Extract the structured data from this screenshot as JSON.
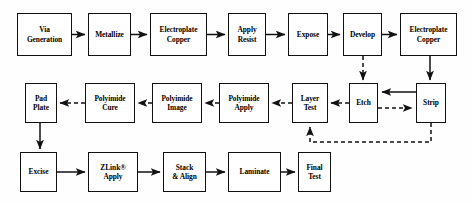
{
  "diagram": {
    "type": "process-flowchart",
    "background_color": "#fefefe",
    "box_border_color": "#111111",
    "box_fill_color": "#ffffff",
    "connector_color": "#111111",
    "rows": 3,
    "node_count": 19
  },
  "nodes": [
    {
      "id": "via-generation",
      "label": "Via\nGeneration",
      "row": 1,
      "x": 17,
      "y": 13,
      "w": 55,
      "h": 43
    },
    {
      "id": "metallize",
      "label": "Metallize",
      "row": 1,
      "x": 88,
      "y": 13,
      "w": 43,
      "h": 43
    },
    {
      "id": "electroplate-copper-1",
      "label": "Electroplate\nCopper",
      "row": 1,
      "x": 150,
      "y": 13,
      "w": 57,
      "h": 43
    },
    {
      "id": "apply-resist",
      "label": "Apply\nResist",
      "row": 1,
      "x": 228,
      "y": 13,
      "w": 38,
      "h": 43
    },
    {
      "id": "expose",
      "label": "Expose",
      "row": 1,
      "x": 288,
      "y": 13,
      "w": 40,
      "h": 43
    },
    {
      "id": "develop",
      "label": "Develop",
      "row": 1,
      "x": 343,
      "y": 13,
      "w": 39,
      "h": 43
    },
    {
      "id": "electroplate-copper-2",
      "label": "Electroplate\nCopper",
      "row": 1,
      "x": 400,
      "y": 13,
      "w": 57,
      "h": 43
    },
    {
      "id": "pad-plate",
      "label": "Pad\nPlate",
      "row": 2,
      "x": 25,
      "y": 83,
      "w": 32,
      "h": 40
    },
    {
      "id": "polyimide-cure",
      "label": "Polyimide\nCure",
      "row": 2,
      "x": 85,
      "y": 83,
      "w": 50,
      "h": 40
    },
    {
      "id": "polyimide-image",
      "label": "Polyimide\nImage",
      "row": 2,
      "x": 152,
      "y": 83,
      "w": 50,
      "h": 40
    },
    {
      "id": "polyimide-apply",
      "label": "Polyimide\nApply",
      "row": 2,
      "x": 219,
      "y": 83,
      "w": 50,
      "h": 40
    },
    {
      "id": "layer-test",
      "label": "Layer\nTest",
      "row": 2,
      "x": 292,
      "y": 83,
      "w": 36,
      "h": 40
    },
    {
      "id": "etch",
      "label": "Etch",
      "row": 2,
      "x": 349,
      "y": 83,
      "w": 29,
      "h": 40
    },
    {
      "id": "strip",
      "label": "Strip",
      "row": 2,
      "x": 416,
      "y": 83,
      "w": 30,
      "h": 40
    },
    {
      "id": "excise",
      "label": "Excise",
      "row": 3,
      "x": 20,
      "y": 152,
      "w": 37,
      "h": 40
    },
    {
      "id": "zlink-apply",
      "label": "ZLink®\nApply",
      "row": 3,
      "x": 88,
      "y": 152,
      "w": 50,
      "h": 40
    },
    {
      "id": "stack-align",
      "label": "Stack\n& Align",
      "row": 3,
      "x": 163,
      "y": 152,
      "w": 43,
      "h": 40
    },
    {
      "id": "laminate",
      "label": "Laminate",
      "row": 3,
      "x": 228,
      "y": 152,
      "w": 53,
      "h": 40
    },
    {
      "id": "final-test",
      "label": "Final\nTest",
      "row": 3,
      "x": 298,
      "y": 152,
      "w": 33,
      "h": 40
    }
  ],
  "connectors": [
    {
      "id": "via-generation-to-metallize",
      "from": "via-generation",
      "to": "metallize",
      "style": "solid",
      "direction": "right"
    },
    {
      "id": "metallize-to-electroplate-copper-1",
      "from": "metallize",
      "to": "electroplate-copper-1",
      "style": "solid",
      "direction": "right"
    },
    {
      "id": "electroplate-copper-1-to-apply-resist",
      "from": "electroplate-copper-1",
      "to": "apply-resist",
      "style": "solid",
      "direction": "right"
    },
    {
      "id": "apply-resist-to-expose",
      "from": "apply-resist",
      "to": "expose",
      "style": "solid",
      "direction": "right"
    },
    {
      "id": "expose-to-develop",
      "from": "expose",
      "to": "develop",
      "style": "solid",
      "direction": "right"
    },
    {
      "id": "develop-to-electroplate-copper-2",
      "from": "develop",
      "to": "electroplate-copper-2",
      "style": "solid",
      "direction": "right"
    },
    {
      "id": "develop-to-etch",
      "from": "develop",
      "to": "etch",
      "style": "dashed",
      "direction": "down"
    },
    {
      "id": "electroplate-copper-2-to-strip",
      "from": "electroplate-copper-2",
      "to": "strip",
      "style": "solid",
      "direction": "down"
    },
    {
      "id": "strip-to-etch",
      "from": "strip",
      "to": "etch",
      "style": "solid",
      "direction": "left"
    },
    {
      "id": "etch-to-strip",
      "from": "etch",
      "to": "strip",
      "style": "dashed",
      "direction": "right"
    },
    {
      "id": "etch-to-layer-test",
      "from": "etch",
      "to": "layer-test",
      "style": "dashed",
      "direction": "left"
    },
    {
      "id": "layer-test-to-polyimide-apply",
      "from": "layer-test",
      "to": "polyimide-apply",
      "style": "dashed",
      "direction": "left"
    },
    {
      "id": "polyimide-apply-to-polyimide-image",
      "from": "polyimide-apply",
      "to": "polyimide-image",
      "style": "dashed",
      "direction": "left"
    },
    {
      "id": "polyimide-image-to-polyimide-cure",
      "from": "polyimide-image",
      "to": "polyimide-cure",
      "style": "dashed",
      "direction": "left"
    },
    {
      "id": "polyimide-cure-to-pad-plate",
      "from": "polyimide-cure",
      "to": "pad-plate",
      "style": "dashed",
      "direction": "left"
    },
    {
      "id": "strip-feedback-to-layer-test",
      "from": "strip",
      "to": "layer-test",
      "style": "dashed",
      "direction": "feedback-up"
    },
    {
      "id": "pad-plate-to-excise",
      "from": "pad-plate",
      "to": "excise",
      "style": "solid",
      "direction": "down"
    },
    {
      "id": "excise-to-zlink-apply",
      "from": "excise",
      "to": "zlink-apply",
      "style": "solid",
      "direction": "right"
    },
    {
      "id": "zlink-apply-to-stack-align",
      "from": "zlink-apply",
      "to": "stack-align",
      "style": "solid",
      "direction": "right"
    },
    {
      "id": "stack-align-to-laminate",
      "from": "stack-align",
      "to": "laminate",
      "style": "solid",
      "direction": "right"
    },
    {
      "id": "laminate-to-final-test",
      "from": "laminate",
      "to": "final-test",
      "style": "solid",
      "direction": "right"
    }
  ]
}
